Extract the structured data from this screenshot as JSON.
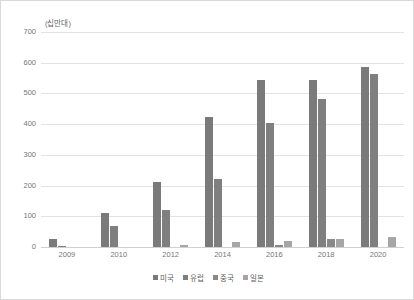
{
  "chart_data": {
    "type": "bar",
    "title": "",
    "subtitle": "",
    "unit_label": "(십만대)",
    "xlabel": "",
    "ylabel": "",
    "categories": [
      "2009",
      "2010",
      "2012",
      "2014",
      "2016",
      "2018",
      "2020"
    ],
    "series": [
      {
        "name": "미국",
        "color": "#7a7a7a",
        "values": [
          25,
          110,
          212,
          422,
          545,
          545,
          585
        ]
      },
      {
        "name": "유럽",
        "color": "#7f7f7f",
        "values": [
          2,
          70,
          122,
          222,
          405,
          483,
          562
        ]
      },
      {
        "name": "중국",
        "color": "#898989",
        "values": [
          0,
          0,
          0,
          0,
          5,
          25,
          0
        ]
      },
      {
        "name": "일본",
        "color": "#a6a6a6",
        "values": [
          0,
          0,
          8,
          15,
          20,
          25,
          32
        ]
      }
    ],
    "ylim": [
      0,
      700
    ],
    "yticks": [
      0,
      100,
      200,
      300,
      400,
      500,
      600,
      700
    ],
    "ytick_labels": [
      "0",
      "100",
      "200",
      "300",
      "400",
      "500",
      "600",
      "700"
    ],
    "grid": true,
    "grid_axis": "y",
    "legend_position": "bottom",
    "background_color": "#ffffff",
    "grid_color": "#e3e3e3",
    "text_color": "#767676",
    "border_color": "#d9d9d9"
  }
}
